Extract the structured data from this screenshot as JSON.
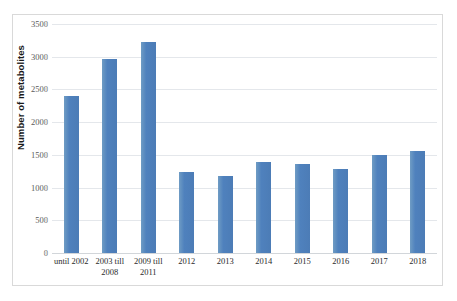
{
  "chart_data": {
    "type": "bar",
    "title": "",
    "subtitle": "",
    "xlabel": "",
    "ylabel": "Number of metabolites",
    "categories": [
      "until 2002",
      "2003 till 2008",
      "2009 till 2011",
      "2012",
      "2013",
      "2014",
      "2015",
      "2016",
      "2017",
      "2018"
    ],
    "category_lines": [
      [
        "until 2002"
      ],
      [
        "2003 till",
        "2008"
      ],
      [
        "2009 till",
        "2011"
      ],
      [
        "2012"
      ],
      [
        "2013"
      ],
      [
        "2014"
      ],
      [
        "2015"
      ],
      [
        "2016"
      ],
      [
        "2017"
      ],
      [
        "2018"
      ]
    ],
    "values": [
      2400,
      2970,
      3230,
      1240,
      1180,
      1390,
      1360,
      1290,
      1500,
      1560
    ],
    "ylim": [
      0,
      3500
    ],
    "ytick_values": [
      0,
      500,
      1000,
      1500,
      2000,
      2500,
      3000,
      3500
    ],
    "ytick_labels": [
      "0",
      "500",
      "1000",
      "1500",
      "2000",
      "2500",
      "3000",
      "3500"
    ],
    "grid": true,
    "grid_axis": "y",
    "legend": false,
    "legend_position": "none",
    "series": [
      {
        "name": "Number of metabolites",
        "values": [
          2400,
          2970,
          3230,
          1240,
          1180,
          1390,
          1360,
          1290,
          1500,
          1560
        ]
      }
    ],
    "colors": {
      "bar": "#4f81bd",
      "bar_highlight": "#6f9cc4",
      "gridline": "#e4e7eb",
      "axis_text": "#5a5a5a",
      "category_text": "#2b2b2b",
      "frame": "#d9d9d9",
      "background": "#ffffff"
    }
  }
}
